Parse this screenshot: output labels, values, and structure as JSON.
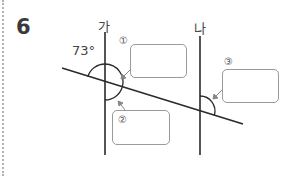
{
  "question": {
    "number": "6"
  },
  "diagram": {
    "line_labels": [
      "가",
      "나"
    ],
    "given_angle": "73°",
    "answer_markers": [
      "①",
      "②",
      "③"
    ],
    "answer_boxes": [
      {
        "marker": "①",
        "value": ""
      },
      {
        "marker": "②",
        "value": ""
      },
      {
        "marker": "③",
        "value": ""
      }
    ],
    "colors": {
      "line": "#2a2a2a",
      "box_border": "#9a9a9a",
      "arrow": "#888888"
    }
  }
}
